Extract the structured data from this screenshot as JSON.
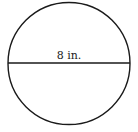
{
  "diagram": {
    "shape": "circle",
    "diameter_label": "8 in.",
    "stroke_color": "#1a1a1a",
    "background": "#ffffff"
  }
}
